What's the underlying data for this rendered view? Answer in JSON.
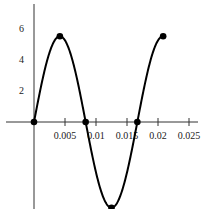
{
  "chart_data": {
    "type": "line",
    "title": "",
    "xlabel": "",
    "ylabel": "",
    "function": "y = 5.5 sin(2π·60·t)",
    "amplitude": 5.5,
    "frequency": 60,
    "xlim": [
      0,
      0.0258
    ],
    "ylim": [
      -5.6,
      7.5
    ],
    "x_ticks": [
      0.005,
      0.01,
      0.015,
      0.02,
      0.025
    ],
    "x_tick_labels": [
      "0.005",
      "0.01",
      "0.015",
      "0.02",
      "0.025"
    ],
    "y_ticks": [
      2,
      4,
      6
    ],
    "y_tick_labels": [
      "2",
      "4",
      "6"
    ],
    "curve_x_range": [
      0,
      0.02083
    ],
    "marked_points": [
      {
        "x": 0,
        "y": 0
      },
      {
        "x": 0.00417,
        "y": 5.5
      },
      {
        "x": 0.00833,
        "y": 0
      },
      {
        "x": 0.0125,
        "y": -5.5
      },
      {
        "x": 0.01667,
        "y": 0
      },
      {
        "x": 0.02083,
        "y": 5.5
      }
    ],
    "grid": false,
    "legend": null
  },
  "layout": {
    "origin_px": [
      34,
      122
    ],
    "x_px_per_unit": 6200,
    "y_px_per_unit": 15.6,
    "y_axis_top_px": 4,
    "y_axis_bottom_px": 209,
    "x_axis_left_px": 6,
    "x_axis_right_px": 198,
    "colors": {
      "curve": "#000000",
      "axis": "#333333",
      "text": "#222222"
    }
  }
}
